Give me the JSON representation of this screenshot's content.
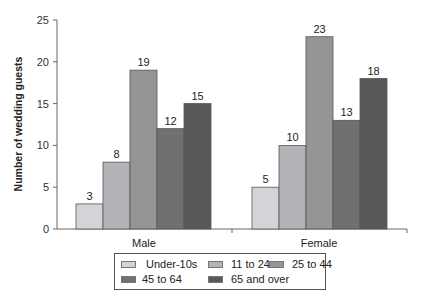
{
  "chart_data": {
    "type": "bar",
    "title": "",
    "xlabel": "",
    "ylabel": "Number of wedding guests",
    "ylim": [
      0,
      25
    ],
    "yticks": [
      0,
      5,
      10,
      15,
      20,
      25
    ],
    "grid": false,
    "legend_position": "bottom",
    "categories": [
      "Male",
      "Female"
    ],
    "series": [
      {
        "name": "Under-10s",
        "values": [
          3,
          5
        ],
        "color": "#d4d4d8"
      },
      {
        "name": "11 to 24",
        "values": [
          8,
          10
        ],
        "color": "#b4b4b8"
      },
      {
        "name": "25 to 44",
        "values": [
          19,
          23
        ],
        "color": "#959597"
      },
      {
        "name": "45 to 64",
        "values": [
          12,
          13
        ],
        "color": "#707072"
      },
      {
        "name": "65 and over",
        "values": [
          15,
          18
        ],
        "color": "#58585a"
      }
    ]
  },
  "axis": {
    "ylabel": "Number of wedding guests",
    "yticks": [
      "0",
      "5",
      "10",
      "15",
      "20",
      "25"
    ],
    "categories": [
      "Male",
      "Female"
    ]
  },
  "legend": {
    "items": [
      {
        "label": "Under-10s",
        "color": "#d4d4d8"
      },
      {
        "label": "11 to 24",
        "color": "#b4b4b8"
      },
      {
        "label": "25 to 44",
        "color": "#959597"
      },
      {
        "label": "45 to 64",
        "color": "#707072"
      },
      {
        "label": "65 and over",
        "color": "#58585a"
      }
    ]
  }
}
